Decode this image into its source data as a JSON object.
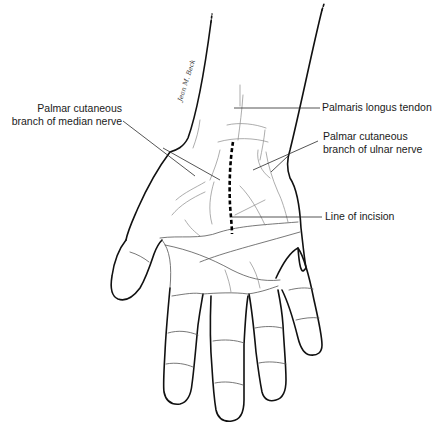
{
  "figure": {
    "signature": "Jean M. Beck",
    "labels": {
      "median_nerve_branch_line1": "Palmar cutaneous",
      "median_nerve_branch_line2": "branch of median nerve",
      "palmaris_longus": "Palmaris longus tendon",
      "ulnar_nerve_branch_line1": "Palmar cutaneous",
      "ulnar_nerve_branch_line2": "branch of ulnar nerve",
      "incision": "Line of incision"
    },
    "colors": {
      "outline": "#111111",
      "detail": "#8a8a8a",
      "label_text": "#1a1a1a",
      "background": "#ffffff"
    }
  }
}
